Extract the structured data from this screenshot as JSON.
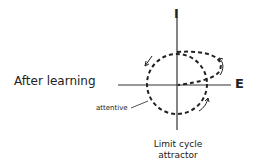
{
  "diagram": {
    "condition_label": "After learning",
    "axis_vertical_label": "I",
    "axis_horizontal_label": "E",
    "annotation": "attentive",
    "caption_line1": "Limit cycle",
    "caption_line2": "attractor"
  }
}
